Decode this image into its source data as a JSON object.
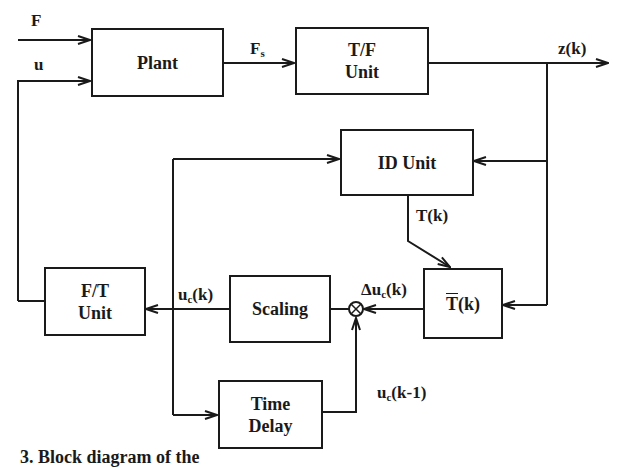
{
  "figure": {
    "type": "block-diagram",
    "caption_partial": "3. Block diagram of the"
  },
  "blocks": {
    "plant": {
      "label": "Plant"
    },
    "tf_unit": {
      "line1": "T/F",
      "line2": "Unit"
    },
    "id_unit": {
      "label": "ID Unit"
    },
    "tbar": {
      "base": "T",
      "rest": "(k)"
    },
    "scaling": {
      "label": "Scaling"
    },
    "ft_unit": {
      "line1": "F/T",
      "line2": "Unit"
    },
    "time_delay": {
      "line1": "Time",
      "line2": "Delay"
    }
  },
  "signals": {
    "F": "F",
    "u": "u",
    "Fs_base": "F",
    "Fs_sub": "s",
    "zk": "z(k)",
    "Tk": "T(k)",
    "delta_uc_prefix": "Δu",
    "delta_uc_sub": "c",
    "delta_uc_suffix": "(k)",
    "uc_base": "u",
    "uc_sub": "c",
    "uc_suffix": "(k)",
    "uck1_base": "u",
    "uck1_sub": "c",
    "uck1_suffix": "(k-1)"
  },
  "junction": {
    "symbol": "⊗",
    "type": "summing-junction"
  },
  "colors": {
    "line": "#1a1a1a",
    "background": "#ffffff"
  }
}
